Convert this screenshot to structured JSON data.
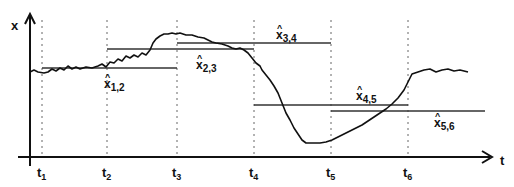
{
  "diagram": {
    "y_axis_label": "x",
    "x_axis_label": "t",
    "time_marks": [
      {
        "base": "t",
        "sub": "1",
        "x": 42
      },
      {
        "base": "t",
        "sub": "2",
        "x": 107
      },
      {
        "base": "t",
        "sub": "3",
        "x": 177
      },
      {
        "base": "t",
        "sub": "4",
        "x": 254
      },
      {
        "base": "t",
        "sub": "5",
        "x": 331
      },
      {
        "base": "t",
        "sub": "6",
        "x": 408
      }
    ],
    "estimates": [
      {
        "base": "x",
        "hat": "^",
        "sub": "1,2",
        "x1": 42,
        "x2": 177,
        "y": 68,
        "lx": 104,
        "ly": 88
      },
      {
        "base": "x",
        "hat": "^",
        "sub": "2,3",
        "x1": 107,
        "x2": 254,
        "y": 49,
        "lx": 196,
        "ly": 69
      },
      {
        "base": "x",
        "hat": "^",
        "sub": "3,4",
        "x1": 177,
        "x2": 331,
        "y": 43,
        "lx": 276,
        "ly": 39
      },
      {
        "base": "x",
        "hat": "^",
        "sub": "4,5",
        "x1": 254,
        "x2": 408,
        "y": 105,
        "lx": 356,
        "ly": 100
      },
      {
        "base": "x",
        "hat": "^",
        "sub": "5,6",
        "x1": 331,
        "x2": 485,
        "y": 111,
        "lx": 434,
        "ly": 127
      }
    ],
    "colors": {
      "line": "#111111",
      "dotted": "#666666",
      "estimate": "#333333"
    }
  }
}
